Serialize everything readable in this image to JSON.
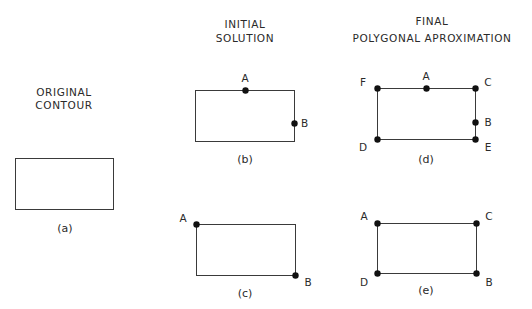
{
  "headers": {
    "original": [
      "ORIGINAL",
      "CONTOUR"
    ],
    "initial": [
      "INITIAL",
      "SOLUTION"
    ],
    "final": [
      "FINAL",
      "POLYGONAL APROXIMATION"
    ]
  },
  "panels": [
    {
      "id": "a",
      "caption": "(a)",
      "rect": {
        "x": 15,
        "y": 158,
        "w": 98,
        "h": 51
      },
      "points": []
    },
    {
      "id": "b",
      "caption": "(b)",
      "rect": {
        "x": 195,
        "y": 90,
        "w": 99,
        "h": 51
      },
      "points": [
        {
          "label": "A",
          "x": 245,
          "y": 90,
          "lx": 245,
          "ly": 82,
          "anchor": "middle"
        },
        {
          "label": "B",
          "x": 294,
          "y": 123,
          "lx": 301,
          "ly": 127,
          "anchor": "start"
        }
      ]
    },
    {
      "id": "c",
      "caption": "(c)",
      "rect": {
        "x": 196,
        "y": 224,
        "w": 99,
        "h": 51
      },
      "points": [
        {
          "label": "A",
          "x": 196,
          "y": 224,
          "lx": 183,
          "ly": 222,
          "anchor": "middle"
        },
        {
          "label": "B",
          "x": 295,
          "y": 275,
          "lx": 308,
          "ly": 286,
          "anchor": "middle"
        }
      ]
    },
    {
      "id": "d",
      "caption": "(d)",
      "rect": {
        "x": 377,
        "y": 88,
        "w": 98,
        "h": 51
      },
      "points": [
        {
          "label": "F",
          "x": 377,
          "y": 88,
          "lx": 363,
          "ly": 86,
          "anchor": "middle"
        },
        {
          "label": "A",
          "x": 426,
          "y": 88,
          "lx": 426,
          "ly": 80,
          "anchor": "middle"
        },
        {
          "label": "C",
          "x": 475,
          "y": 88,
          "lx": 488,
          "ly": 86,
          "anchor": "middle"
        },
        {
          "label": "B",
          "x": 475,
          "y": 122,
          "lx": 488,
          "ly": 126,
          "anchor": "middle"
        },
        {
          "label": "D",
          "x": 377,
          "y": 139,
          "lx": 363,
          "ly": 151,
          "anchor": "middle"
        },
        {
          "label": "E",
          "x": 475,
          "y": 139,
          "lx": 488,
          "ly": 151,
          "anchor": "middle"
        }
      ]
    },
    {
      "id": "e",
      "caption": "(e)",
      "rect": {
        "x": 377,
        "y": 223,
        "w": 99,
        "h": 50
      },
      "points": [
        {
          "label": "A",
          "x": 377,
          "y": 223,
          "lx": 364,
          "ly": 220,
          "anchor": "middle"
        },
        {
          "label": "C",
          "x": 476,
          "y": 223,
          "lx": 489,
          "ly": 220,
          "anchor": "middle"
        },
        {
          "label": "D",
          "x": 377,
          "y": 273,
          "lx": 364,
          "ly": 286,
          "anchor": "middle"
        },
        {
          "label": "B",
          "x": 476,
          "y": 273,
          "lx": 489,
          "ly": 286,
          "anchor": "middle"
        }
      ]
    }
  ],
  "captions_pos": {
    "a": {
      "x": 65,
      "y": 232
    },
    "b": {
      "x": 245,
      "y": 163
    },
    "c": {
      "x": 245,
      "y": 297
    },
    "d": {
      "x": 426,
      "y": 163
    },
    "e": {
      "x": 426,
      "y": 294
    }
  }
}
